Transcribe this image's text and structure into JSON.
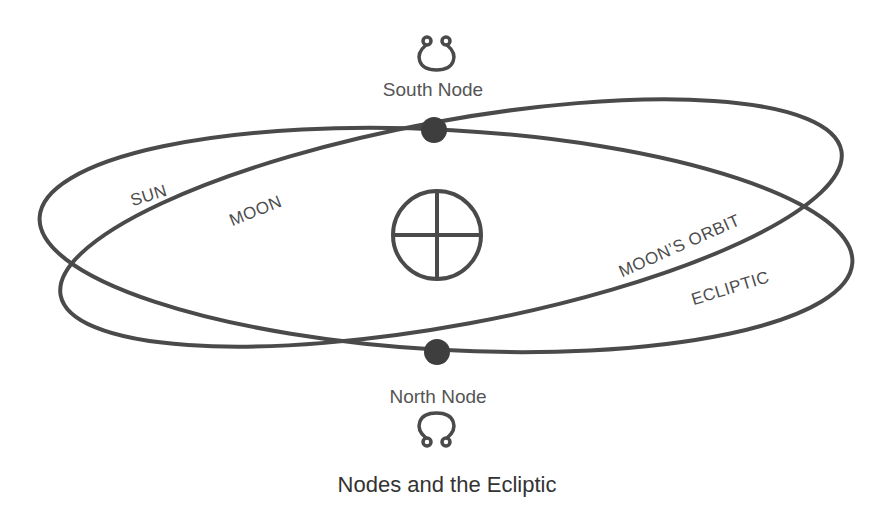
{
  "title": "Nodes and the Ecliptic",
  "nodes": {
    "south": {
      "label": "South Node",
      "symbol": "south-node-symbol",
      "position": [
        434,
        130
      ]
    },
    "north": {
      "label": "North Node",
      "symbol": "north-node-symbol",
      "position": [
        437,
        352
      ]
    }
  },
  "center_symbol": "earth-symbol",
  "orbits": {
    "ecliptic": {
      "left_label": "SUN",
      "right_label": "ECLIPTIC"
    },
    "moon_orbit": {
      "left_label": "MOON",
      "right_label": "MOON’S ORBIT"
    }
  },
  "colors": {
    "stroke": "#4a4a4a",
    "node_fill": "#3e3e3e",
    "text": "#555555",
    "background": "#ffffff"
  }
}
